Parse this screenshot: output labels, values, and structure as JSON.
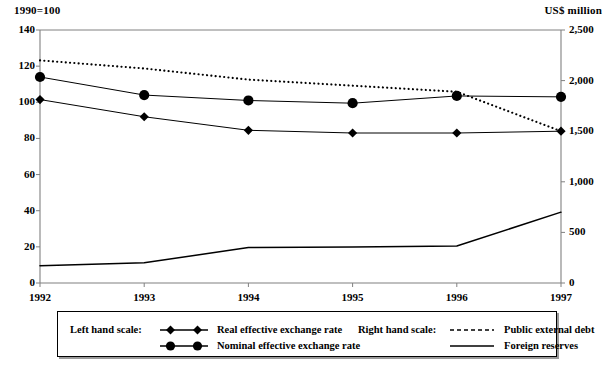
{
  "axes": {
    "left_unit": "1990=100",
    "right_unit": "US$ million",
    "left_ticks": [
      "0",
      "20",
      "40",
      "60",
      "80",
      "100",
      "120",
      "140"
    ],
    "right_ticks": [
      "0",
      "500",
      "1,000",
      "1,500",
      "2,000",
      "2,500"
    ],
    "x_ticks": [
      "1992",
      "1993",
      "1994",
      "1995",
      "1996",
      "1997"
    ]
  },
  "legend": {
    "left_scale_label": "Left hand scale:",
    "right_scale_label": "Right hand scale:",
    "items": [
      {
        "label": "Real effective exchange rate",
        "marker": "diamond-marker-icon",
        "scale": "left"
      },
      {
        "label": "Nominal effective exchange rate",
        "marker": "circle-marker-icon",
        "scale": "left"
      },
      {
        "label": "Public external debt",
        "marker": "dashed-line-icon",
        "scale": "right"
      },
      {
        "label": "Foreign reserves",
        "marker": "solid-line-icon",
        "scale": "right"
      }
    ]
  },
  "chart_data": {
    "type": "line",
    "title": "",
    "xlabel": "",
    "ylabel": "1990=100",
    "y2label": "US$ million",
    "categories": [
      "1992",
      "1993",
      "1994",
      "1995",
      "1996",
      "1997"
    ],
    "ylim": [
      0,
      140
    ],
    "y2lim": [
      0,
      2500
    ],
    "ytick_step": 20,
    "y2tick_step": 500,
    "grid": false,
    "legend_position": "bottom",
    "series": [
      {
        "name": "Real effective exchange rate",
        "axis": "left",
        "marker": "diamond",
        "line": "solid",
        "values": [
          101.5,
          92.0,
          84.5,
          83.0,
          83.0,
          84.0
        ]
      },
      {
        "name": "Nominal effective exchange rate",
        "axis": "left",
        "marker": "circle",
        "line": "solid",
        "values": [
          114.0,
          104.0,
          101.0,
          99.5,
          103.5,
          103.0
        ]
      },
      {
        "name": "Public external debt",
        "axis": "right",
        "marker": "none",
        "line": "dotted",
        "values": [
          2200,
          2120,
          2010,
          1950,
          1890,
          1500
        ]
      },
      {
        "name": "Foreign reserves",
        "axis": "right",
        "marker": "none",
        "line": "solid",
        "values": [
          170,
          200,
          350,
          355,
          365,
          700
        ]
      }
    ]
  },
  "colors": {
    "ink": "#000000",
    "frame": "#808080",
    "background": "#ffffff"
  }
}
